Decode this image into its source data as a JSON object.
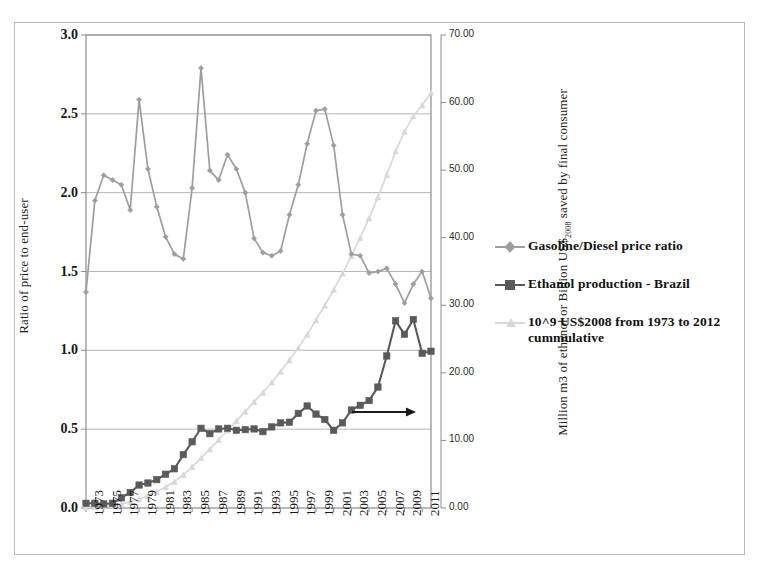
{
  "chart_data": {
    "type": "line",
    "title": "",
    "xlabel": "",
    "ylabel": "Ratio of price to end-user",
    "y2label": "Million m3 of ethanol or Billion US$2008 saved by final consumer",
    "xlim": [
      1973,
      2012
    ],
    "ylim": [
      0.0,
      3.0
    ],
    "y2lim": [
      0.0,
      70.0
    ],
    "grid": true,
    "legend_position": "right",
    "y_ticks": [
      "0.0",
      "0.5",
      "1.0",
      "1.5",
      "2.0",
      "2.5",
      "3.0"
    ],
    "y2_ticks": [
      "0.00",
      "10.00",
      "20.00",
      "30.00",
      "40.00",
      "50.00",
      "60.00",
      "70.00"
    ],
    "x_ticks": [
      "1973",
      "1975",
      "1977",
      "1979",
      "1981",
      "1983",
      "1985",
      "1987",
      "1989",
      "1991",
      "1993",
      "1995",
      "1997",
      "1999",
      "2001",
      "2003",
      "2005",
      "2007",
      "2009",
      "2011"
    ],
    "x": [
      1973,
      1974,
      1975,
      1976,
      1977,
      1978,
      1979,
      1980,
      1981,
      1982,
      1983,
      1984,
      1985,
      1986,
      1987,
      1988,
      1989,
      1990,
      1991,
      1992,
      1993,
      1994,
      1995,
      1996,
      1997,
      1998,
      1999,
      2000,
      2001,
      2002,
      2003,
      2004,
      2005,
      2006,
      2007,
      2008,
      2009,
      2010,
      2011,
      2012
    ],
    "series": [
      {
        "name": "Gasoline/Diesel price ratio",
        "axis": "left",
        "color": "#9e9e9e",
        "marker": "diamond",
        "values": [
          1.37,
          1.95,
          2.11,
          2.08,
          2.05,
          1.89,
          2.59,
          2.15,
          1.91,
          1.72,
          1.61,
          1.58,
          2.03,
          2.79,
          2.14,
          2.08,
          2.24,
          2.15,
          2.0,
          1.71,
          1.62,
          1.6,
          1.63,
          1.86,
          2.05,
          2.31,
          2.52,
          2.53,
          2.3,
          1.86,
          1.61,
          1.6,
          1.49,
          1.5,
          1.52,
          1.42,
          1.3,
          1.42,
          1.5,
          1.33
        ]
      },
      {
        "name": "Ethanol production - Brazil",
        "axis": "right",
        "color": "#5a5a5a",
        "marker": "square",
        "values": [
          0.7,
          0.7,
          0.6,
          0.7,
          1.5,
          2.3,
          3.4,
          3.7,
          4.2,
          5.0,
          5.8,
          7.9,
          9.8,
          11.8,
          11.0,
          11.7,
          11.8,
          11.5,
          11.6,
          11.7,
          11.3,
          12.0,
          12.6,
          12.7,
          14.0,
          15.1,
          13.9,
          13.1,
          11.5,
          12.6,
          14.5,
          15.2,
          15.9,
          17.9,
          22.5,
          27.7,
          25.7,
          27.9,
          22.9,
          23.2
        ]
      },
      {
        "name": "10^9 US$2008 from 1973 to 2012 cummulative",
        "axis": "right",
        "color": "#d8d8d8",
        "marker": "triangle",
        "values": [
          0.1,
          0.2,
          0.3,
          0.4,
          0.6,
          0.9,
          1.3,
          1.8,
          2.4,
          3.1,
          3.9,
          4.9,
          6.1,
          7.4,
          8.7,
          10.1,
          11.5,
          12.9,
          14.3,
          15.7,
          17.1,
          18.6,
          20.2,
          21.9,
          23.7,
          25.7,
          27.8,
          30.0,
          32.3,
          34.7,
          37.3,
          40.0,
          42.9,
          46.0,
          49.3,
          52.8,
          55.7,
          58.0,
          59.6,
          61.5
        ]
      }
    ],
    "annotations": [
      {
        "type": "arrow",
        "label": "right-axis-pointer",
        "direction": "right"
      }
    ]
  },
  "legend": {
    "items": [
      {
        "label": "Gasoline/Diesel price ratio",
        "color": "#9e9e9e",
        "marker": "diamond"
      },
      {
        "label": "Ethanol production - Brazil",
        "color": "#5a5a5a",
        "marker": "square"
      },
      {
        "label": "10^9 US$2008 from 1973 to 2012 cummulative",
        "color": "#d8d8d8",
        "marker": "triangle"
      }
    ]
  },
  "axes": {
    "left_title": "Ratio of price to end-user",
    "right_title_pre": "Million m3 of ethanol or Billion US$",
    "right_title_sub": "2008",
    "right_title_post": " saved by final consumer"
  }
}
